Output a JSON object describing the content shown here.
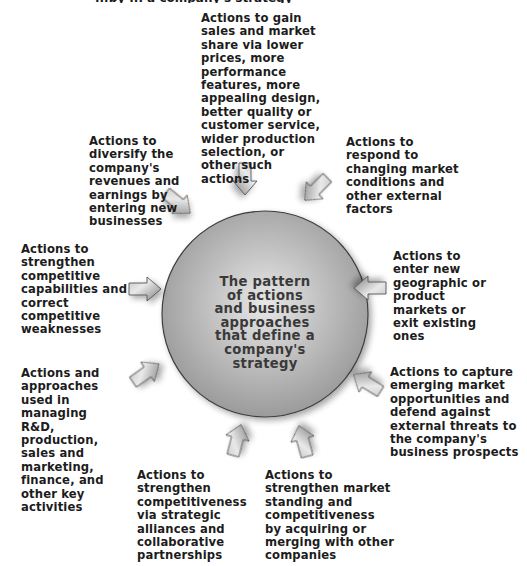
{
  "diagram": {
    "title_fragment": "...by ... a company's strategy",
    "center": {
      "text": "The pattern\nof actions\nand business\napproaches\nthat define a\ncompany's\nstrategy",
      "fill_color": "#a8a8a8",
      "highlight_color": "#e6e6e6",
      "stroke_color": "#444444"
    },
    "arrow_fill": "#9a9a9a",
    "nodes": [
      {
        "id": "top",
        "text": "Actions to gain\nsales and market\nshare via lower\nprices, more\nperformance\nfeatures, more\nappealing design,\nbetter quality or\ncustomer service,\nwider production\nselection, or\nother such\nactions"
      },
      {
        "id": "top-right",
        "text": "Actions to\nrespond to\nchanging market\nconditions and\nother external\nfactors"
      },
      {
        "id": "right",
        "text": "Actions to\nenter new\ngeographic or\nproduct\nmarkets or\nexit existing\nones"
      },
      {
        "id": "bottom-right",
        "text": "Actions to capture\nemerging market\nopportunities and\ndefend against\nexternal threats to\nthe company's\nbusiness prospects"
      },
      {
        "id": "bottom-center-right",
        "text": "Actions to\nstrengthen market\nstanding and\ncompetitiveness\nby acquiring or\nmerging with other\ncompanies"
      },
      {
        "id": "bottom-center-left",
        "text": "Actions to\nstrengthen\ncompetitiveness\nvia strategic\nalliances and\ncollaborative\npartnerships"
      },
      {
        "id": "bottom-left",
        "text": "Actions and\napproaches\nused in\nmanaging\nR&D,\nproduction,\nsales and\nmarketing,\nfinance, and\nother key\nactivities"
      },
      {
        "id": "left",
        "text": "Actions to\nstrengthen\ncompetitive\ncapabilities and\ncorrect\ncompetitive\nweaknesses"
      },
      {
        "id": "top-left",
        "text": "Actions to\ndiversify the\ncompany's\nrevenues and\nearnings by\nentering new\nbusinesses"
      }
    ]
  }
}
